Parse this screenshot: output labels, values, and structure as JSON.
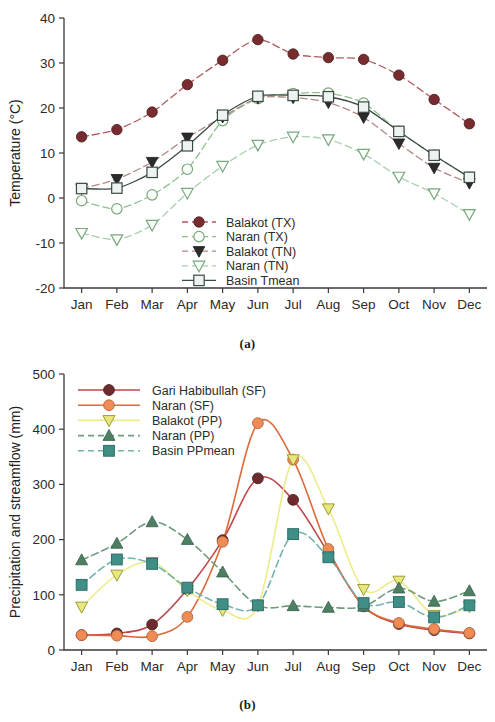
{
  "figure": {
    "panel_a_caption": "(a)",
    "panel_b_caption": "(b)"
  },
  "chart_data": [
    {
      "type": "line",
      "panel": "(a)",
      "title": "",
      "xlabel": "",
      "ylabel": "Temperature (°C)",
      "categories": [
        "Jan",
        "Feb",
        "Mar",
        "Apr",
        "May",
        "Jun",
        "Jul",
        "Aug",
        "Sep",
        "Oct",
        "Nov",
        "Dec"
      ],
      "ylim": [
        -20,
        40
      ],
      "yticks": [
        -20,
        -10,
        0,
        10,
        20,
        30,
        40
      ],
      "ytick_labels": [
        "-20",
        "-10",
        "0",
        "10",
        "20",
        "30",
        "40"
      ],
      "grid": false,
      "legend_position": "inside-lower-right",
      "series": [
        {
          "name": "Balakot (TX)",
          "color": "#7a2b2e",
          "line_color": "#b05a5e",
          "line_style": "dashed",
          "marker": "circle-filled",
          "values": [
            13.6,
            15.2,
            19.1,
            25.2,
            30.6,
            35.2,
            32.0,
            31.2,
            30.8,
            27.3,
            21.9,
            16.5
          ]
        },
        {
          "name": "Naran (TX)",
          "color": "#ffffff",
          "line_color": "#8fbf8f",
          "line_style": "dashed",
          "marker": "circle-open",
          "values": [
            -0.6,
            -2.4,
            0.7,
            6.4,
            17.2,
            22.1,
            23.2,
            23.3,
            21.1,
            14.8,
            9.5,
            4.6
          ]
        },
        {
          "name": "Balakot (TN)",
          "color": "#2b2b2b",
          "line_color": "#b08a85",
          "line_style": "dashed",
          "marker": "triangle-down-filled",
          "values": [
            2.1,
            4.2,
            8.0,
            13.4,
            18.0,
            22.2,
            22.3,
            21.2,
            17.9,
            12.1,
            6.7,
            3.3
          ]
        },
        {
          "name": "Naran (TN)",
          "color": "#ffffff",
          "line_color": "#a8cfae",
          "line_style": "dashed",
          "marker": "triangle-down-open",
          "values": [
            -7.8,
            -9.2,
            -6.0,
            1.1,
            7.1,
            11.8,
            13.6,
            13.0,
            9.8,
            4.7,
            1.0,
            -3.6
          ]
        },
        {
          "name": "Basin Tmean",
          "color": "#e8ecea",
          "line_color": "#3b4a42",
          "line_style": "solid",
          "marker": "square-open",
          "values": [
            2.1,
            2.2,
            5.7,
            11.6,
            18.4,
            22.6,
            22.8,
            22.5,
            20.2,
            14.8,
            9.5,
            4.6
          ]
        }
      ]
    },
    {
      "type": "line",
      "panel": "(b)",
      "title": "",
      "xlabel": "",
      "ylabel": "Precipitation and streamflow (mm)",
      "categories": [
        "Jan",
        "Feb",
        "Mar",
        "Apr",
        "May",
        "Jun",
        "Jul",
        "Aug",
        "Sep",
        "Oct",
        "Nov",
        "Dec"
      ],
      "ylim": [
        0,
        500
      ],
      "yticks": [
        0,
        100,
        200,
        300,
        400,
        500
      ],
      "ytick_labels": [
        "0",
        "100",
        "200",
        "300",
        "400",
        "500"
      ],
      "grid": false,
      "legend_position": "inside-upper-left",
      "series": [
        {
          "name": "Gari Habibullah (SF)",
          "color": "#6e2b2e",
          "line_color": "#c0474a",
          "line_style": "solid",
          "marker": "circle-filled",
          "values": [
            27,
            30,
            46,
            110,
            199,
            311,
            272,
            176,
            79,
            47,
            36,
            30
          ]
        },
        {
          "name": "Naran (SF)",
          "color": "#ef8b54",
          "line_color": "#d96a3a",
          "line_style": "solid",
          "marker": "circle-filled-orange",
          "values": [
            27,
            26,
            25,
            60,
            196,
            411,
            345,
            183,
            80,
            49,
            38,
            31
          ]
        },
        {
          "name": "Balakot (PP)",
          "color": "#e8e87a",
          "line_color": "#eeeb8a",
          "line_style": "solid",
          "marker": "triangle-down-filled-yellow",
          "values": [
            78,
            136,
            159,
            108,
            72,
            80,
            345,
            256,
            110,
            125,
            63,
            79
          ]
        },
        {
          "name": "Naran (PP)",
          "color": "#4e7f63",
          "line_color": "#6f9d7e",
          "line_style": "dashed",
          "marker": "triangle-up-filled",
          "values": [
            163,
            193,
            232,
            200,
            141,
            81,
            80,
            77,
            79,
            112,
            88,
            107
          ]
        },
        {
          "name": "Basin PPmean",
          "color": "#3f8f86",
          "line_color": "#74b3ad",
          "line_style": "dashed",
          "marker": "square-filled-teal",
          "values": [
            118,
            164,
            156,
            113,
            83,
            81,
            210,
            168,
            85,
            87,
            59,
            81
          ]
        }
      ]
    }
  ]
}
